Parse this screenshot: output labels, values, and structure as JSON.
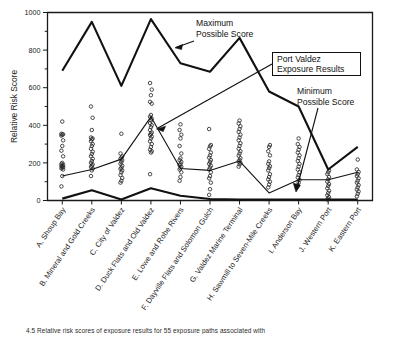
{
  "figure": {
    "title": "",
    "y_axis_title": "Relative Risk Score",
    "caption": "4.5    Relative risk scores of exposure results for 55 exposure paths associated with"
  },
  "annotations": {
    "maximum": {
      "line1": "Maximum",
      "line2": "Possible Score"
    },
    "exposure": {
      "line1": "Port Valdez",
      "line2": "Exposure Results"
    },
    "minimum": {
      "line1": "Minimum",
      "line2": "Possible Score"
    }
  },
  "chart_data": {
    "type": "scatter",
    "title": "",
    "xlabel": "",
    "ylabel": "Relative Risk Score",
    "ylim": [
      0,
      1000
    ],
    "yticks": [
      0,
      200,
      400,
      600,
      800,
      1000
    ],
    "yticklabels": [
      "0",
      "200",
      "400",
      "600",
      "800",
      "1000"
    ],
    "yminorticks": [
      100,
      300,
      500,
      700,
      900
    ],
    "grid": false,
    "legend_position": "annotations-inline",
    "categories": [
      "A. Shoup Bay",
      "B. Mineral and Gold Creeks",
      "C. City of Valdez",
      "D. Duck Flats and Old Valdez",
      "E. Lowe and Robe Rivers",
      "F. Dayville Flats and Solomon Gulch",
      "G. Valdez Marine Terminal",
      "H. Sawmill to Seven-Mile Creeks",
      "I. Anderson Bay",
      "J. Western Port",
      "K. Eastern Port"
    ],
    "series": [
      {
        "name": "Maximum Possible Score",
        "style": "thick-line",
        "values": [
          690,
          950,
          610,
          965,
          730,
          685,
          865,
          580,
          500,
          165,
          285
        ]
      },
      {
        "name": "Port Valdez Exposure Results",
        "style": "thin-line",
        "values": [
          130,
          165,
          220,
          445,
          170,
          160,
          210,
          40,
          110,
          110,
          150
        ]
      },
      {
        "name": "Minimum Possible Score",
        "style": "thick-line",
        "values": [
          10,
          55,
          5,
          65,
          25,
          8,
          5,
          5,
          5,
          5,
          5
        ]
      }
    ],
    "scatter_points": [
      {
        "category": "A. Shoup Bay",
        "values": [
          75,
          130,
          165,
          170,
          175,
          178,
          182,
          185,
          190,
          195,
          200,
          235,
          265,
          290,
          320,
          345,
          350,
          352,
          355,
          420
        ]
      },
      {
        "category": "B. Mineral and Gold Creeks",
        "values": [
          130,
          160,
          170,
          178,
          185,
          192,
          200,
          210,
          222,
          235,
          248,
          260,
          275,
          290,
          300,
          315,
          325,
          330,
          335,
          375,
          440,
          500
        ]
      },
      {
        "category": "C. City of Valdez",
        "values": [
          95,
          105,
          120,
          135,
          150,
          160,
          168,
          175,
          185,
          195,
          205,
          215,
          222,
          228,
          235,
          250,
          355
        ]
      },
      {
        "category": "D. Duck Flats and Old Valdez",
        "values": [
          140,
          255,
          262,
          270,
          285,
          300,
          315,
          330,
          340,
          348,
          355,
          362,
          375,
          390,
          400,
          412,
          425,
          435,
          445,
          455,
          515,
          525,
          560,
          590,
          625
        ]
      },
      {
        "category": "E. Lowe and Robe Rivers",
        "values": [
          105,
          125,
          150,
          165,
          172,
          180,
          188,
          195,
          205,
          215,
          225,
          250,
          290,
          330,
          350,
          375,
          405
        ]
      },
      {
        "category": "F. Dayville Flats and Solomon Gulch",
        "values": [
          30,
          60,
          95,
          118,
          130,
          150,
          165,
          175,
          185,
          195,
          205,
          215,
          228,
          240,
          255,
          275,
          288,
          295,
          380
        ]
      },
      {
        "category": "G. Valdez Marine Terminal",
        "values": [
          180,
          192,
          200,
          208,
          215,
          225,
          238,
          250,
          262,
          275,
          290,
          305,
          320,
          335,
          350,
          365,
          380,
          395,
          410,
          425
        ]
      },
      {
        "category": "H. Sawmill to Seven-Mile Creeks",
        "values": [
          70,
          85,
          100,
          112,
          125,
          140,
          160,
          172,
          182,
          195,
          208,
          240,
          262,
          285,
          295
        ]
      },
      {
        "category": "I. Anderson Bay",
        "values": [
          80,
          95,
          110,
          122,
          135,
          150,
          165,
          180,
          195,
          210,
          225,
          240,
          255,
          270,
          285,
          300,
          330
        ]
      },
      {
        "category": "J. Western Port",
        "values": [
          5,
          10,
          18,
          28,
          40,
          52,
          65,
          78,
          88,
          100,
          112,
          125,
          140,
          150,
          160
        ]
      },
      {
        "category": "K. Eastern Port",
        "values": [
          22,
          35,
          48,
          58,
          70,
          82,
          95,
          105,
          118,
          130,
          140,
          152,
          165,
          218
        ]
      }
    ]
  }
}
